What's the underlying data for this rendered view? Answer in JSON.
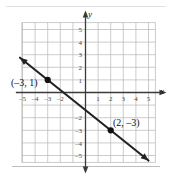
{
  "figure": {
    "kind": "coordinate-plane-line-graph",
    "background_color": "#ffffff",
    "grid_color": "#b6b6b6",
    "axis_color": "#3b3b3b",
    "line_color": "#222222",
    "point_color": "#111111"
  },
  "axes": {
    "x_label": "x",
    "y_label": "y",
    "x_tick_labels": [
      "-5",
      "-4",
      "-3",
      "-2",
      "1",
      "2",
      "3",
      "4",
      "5"
    ],
    "y_tick_labels": [
      "5",
      "4",
      "3",
      "2",
      "1",
      "-2",
      "-3",
      "-4",
      "-5"
    ]
  },
  "annotations": {
    "label_point_a": "(–3, 1)",
    "label_point_b": "(2, –3)"
  },
  "chart_data": {
    "type": "line",
    "title": "",
    "xlabel": "x",
    "ylabel": "y",
    "xlim": [
      -5.5,
      5.5
    ],
    "ylim": [
      -5.5,
      5.5
    ],
    "grid": true,
    "legend": "none",
    "x_ticks": [
      -5,
      -4,
      -3,
      -2,
      -1,
      1,
      2,
      3,
      4,
      5
    ],
    "y_ticks": [
      -5,
      -4,
      -3,
      -2,
      -1,
      1,
      2,
      3,
      4,
      5
    ],
    "x_tick_labels_shown": [
      -5,
      -4,
      -3,
      -2,
      1,
      2,
      3,
      4,
      5
    ],
    "y_tick_labels_shown": [
      5,
      4,
      3,
      2,
      1,
      -2,
      -3,
      -4,
      -5
    ],
    "series": [
      {
        "name": "line",
        "kind": "line-with-arrows",
        "slope": -0.8,
        "intercept": -1.4,
        "equation": "y = -4/5 x - 7/5",
        "endpoints": [
          [
            -5.2,
            2.76
          ],
          [
            5.0,
            -5.4
          ]
        ],
        "arrow_start": true,
        "arrow_end": true
      }
    ],
    "points": [
      {
        "x": -3,
        "y": 1,
        "label": "(–3, 1)",
        "label_position": "left"
      },
      {
        "x": 2,
        "y": -3,
        "label": "(2, –3)",
        "label_position": "above-right"
      }
    ]
  }
}
